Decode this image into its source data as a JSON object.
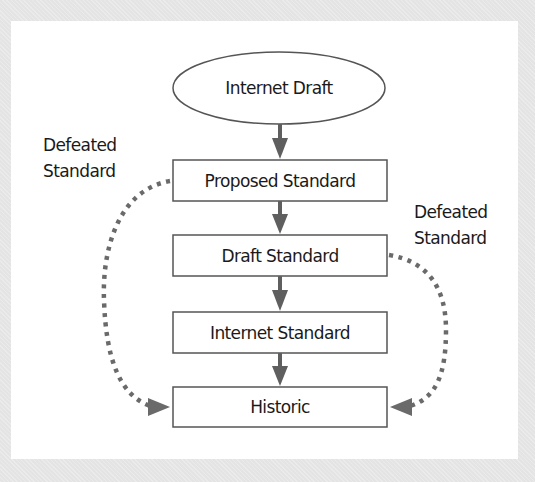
{
  "diagram": {
    "nodes": [
      {
        "id": "internet-draft",
        "label": "Internet Draft",
        "shape": "ellipse"
      },
      {
        "id": "proposed-standard",
        "label": "Proposed Standard",
        "shape": "rect"
      },
      {
        "id": "draft-standard",
        "label": "Draft Standard",
        "shape": "rect"
      },
      {
        "id": "internet-standard",
        "label": "Internet Standard",
        "shape": "rect"
      },
      {
        "id": "historic",
        "label": "Historic",
        "shape": "rect"
      }
    ],
    "edges": [
      {
        "from": "internet-draft",
        "to": "proposed-standard",
        "style": "solid"
      },
      {
        "from": "proposed-standard",
        "to": "draft-standard",
        "style": "solid"
      },
      {
        "from": "draft-standard",
        "to": "internet-standard",
        "style": "solid"
      },
      {
        "from": "internet-standard",
        "to": "historic",
        "style": "solid"
      },
      {
        "from": "proposed-standard",
        "to": "historic",
        "style": "dotted",
        "label": "Defeated Standard"
      },
      {
        "from": "draft-standard",
        "to": "historic",
        "style": "dotted",
        "label": "Defeated Standard"
      }
    ],
    "left_label": {
      "line1": "Defeated",
      "line2": "Standard"
    },
    "right_label": {
      "line1": "Defeated",
      "line2": "Standard"
    },
    "colors": {
      "background": "#e4e4e4",
      "panel": "#ffffff",
      "solid_arrow": "#5f5f5f",
      "dotted_arrow": "#6a6a6a",
      "box_border": "#555555",
      "text": "#1a1a1a"
    }
  }
}
